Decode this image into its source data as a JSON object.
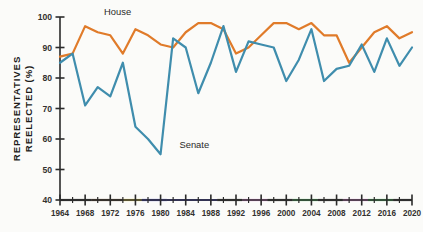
{
  "chart_data": {
    "type": "line",
    "title": "",
    "xlabel": "",
    "ylabel": "REPRESENTATIVES REELECTED (%)",
    "ylim": [
      40,
      100
    ],
    "xlim": [
      1964,
      2020
    ],
    "ytick_labels": [
      "40",
      "50",
      "60",
      "70",
      "80",
      "90",
      "100"
    ],
    "ytick_values": [
      40,
      50,
      60,
      70,
      80,
      90,
      100
    ],
    "xtick_labels": [
      "1964",
      "1968",
      "1972",
      "1976",
      "1980",
      "1984",
      "1988",
      "1992",
      "1996",
      "2000",
      "2004",
      "2008",
      "2012",
      "2016",
      "2020"
    ],
    "xtick_values": [
      1964,
      1968,
      1972,
      1976,
      1980,
      1984,
      1988,
      1992,
      1996,
      2000,
      2004,
      2008,
      2012,
      2016,
      2020
    ],
    "minor_tick_interval": 2,
    "grid": false,
    "legend_position": "inline-annotation",
    "x": [
      1964,
      1966,
      1968,
      1970,
      1972,
      1974,
      1976,
      1978,
      1980,
      1982,
      1984,
      1986,
      1988,
      1990,
      1992,
      1994,
      1996,
      1998,
      2000,
      2002,
      2004,
      2006,
      2008,
      2010,
      2012,
      2014,
      2016,
      2018,
      2020
    ],
    "series": [
      {
        "name": "House",
        "color": "#e07b2a",
        "label": "House",
        "values": [
          87,
          88,
          97,
          95,
          94,
          88,
          96,
          94,
          91,
          90,
          95,
          98,
          98,
          96,
          88,
          90,
          94,
          98,
          98,
          96,
          98,
          94,
          94,
          85,
          90,
          95,
          97,
          93,
          95
        ]
      },
      {
        "name": "Senate",
        "color": "#3f8dad",
        "label": "Senate",
        "values": [
          85,
          88,
          71,
          77,
          74,
          85,
          64,
          60,
          55,
          93,
          90,
          75,
          85,
          97,
          82,
          92,
          91,
          90,
          79,
          86,
          96,
          79,
          83,
          84,
          91,
          82,
          93,
          84,
          90
        ]
      }
    ],
    "annotations": [
      {
        "text": "House",
        "x": 1971,
        "y": 100.5,
        "series": "House"
      },
      {
        "text": "Senate",
        "x": 1983,
        "y": 57,
        "series": "Senate"
      }
    ],
    "axis_term_segments": [
      {
        "from": 1964,
        "to": 1969,
        "color": "#3b3b3b"
      },
      {
        "from": 1969,
        "to": 1974,
        "color": "#5a4430"
      },
      {
        "from": 1974,
        "to": 1977,
        "color": "#e8d24a"
      },
      {
        "from": 1977,
        "to": 1981,
        "color": "#4747c8"
      },
      {
        "from": 1981,
        "to": 1989,
        "color": "#4747c8"
      },
      {
        "from": 1989,
        "to": 1993,
        "color": "#3b3b3b"
      },
      {
        "from": 1993,
        "to": 1997,
        "color": "#d77fd0"
      },
      {
        "from": 1997,
        "to": 2001,
        "color": "#3b3b3b"
      },
      {
        "from": 2001,
        "to": 2005,
        "color": "#4fc36a"
      },
      {
        "from": 2005,
        "to": 2009,
        "color": "#3b3b3b"
      },
      {
        "from": 2009,
        "to": 2013,
        "color": "#d77fd0"
      },
      {
        "from": 2013,
        "to": 2017,
        "color": "#4fc36a"
      },
      {
        "from": 2017,
        "to": 2020,
        "color": "#3b3b3b"
      }
    ]
  },
  "axis": {
    "y_title": "REPRESENTATIVES REELECTED (%)"
  }
}
